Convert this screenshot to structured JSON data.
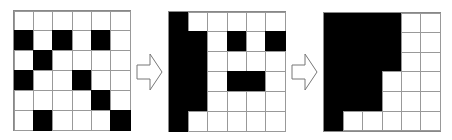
{
  "diagram": {
    "title": "",
    "grids": [
      {
        "name": "grid-step-1",
        "rows": [
          "000000",
          "101010",
          "010000",
          "100100",
          "000010",
          "010001"
        ]
      },
      {
        "name": "grid-step-2",
        "rows": [
          "100000",
          "110101",
          "110000",
          "110110",
          "110000",
          "100000"
        ]
      },
      {
        "name": "grid-step-3",
        "rows": [
          "111100",
          "111100",
          "111100",
          "111000",
          "111000",
          "100000"
        ]
      }
    ],
    "arrows": [
      {
        "from": "grid-step-1",
        "to": "grid-step-2",
        "style": "outline"
      },
      {
        "from": "grid-step-2",
        "to": "grid-step-3",
        "style": "outline"
      }
    ],
    "colors": {
      "filled": "#000000",
      "empty": "#ffffff",
      "gridline": "#999999",
      "arrow_stroke": "#777777"
    }
  }
}
